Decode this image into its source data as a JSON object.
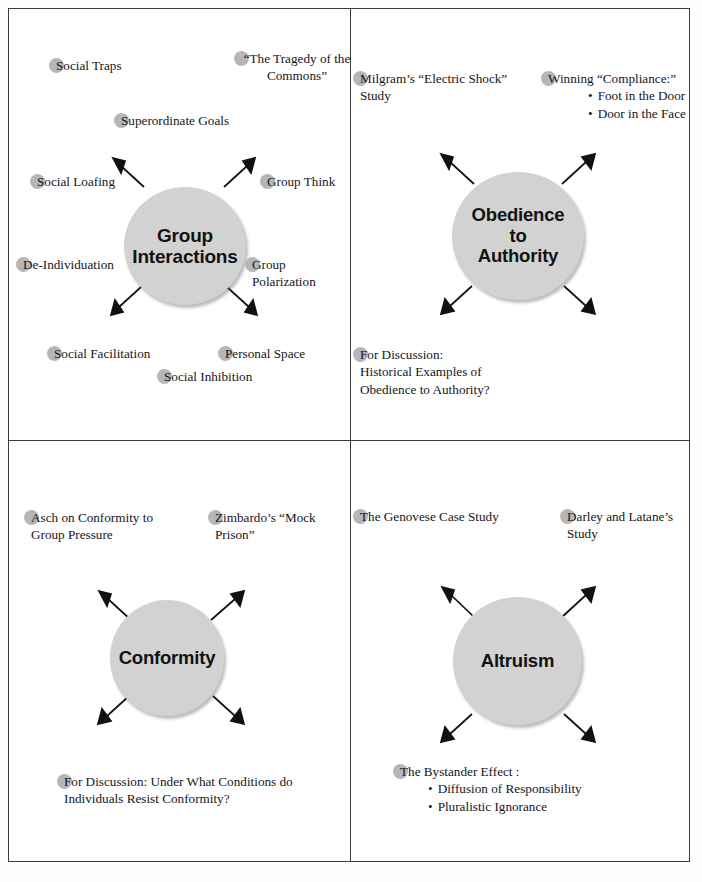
{
  "page": {
    "title": "Social Psychology",
    "title_visible": false,
    "colors": {
      "node_fill": "#d2d2d2",
      "dot_marker": "#b6b6b6",
      "frame_line": "#3b3b3f",
      "text": "#15151a",
      "arrow": "#111111"
    }
  },
  "quadrants": [
    {
      "id": "group-interactions",
      "node_label": "Group\nInteractions",
      "labels": [
        {
          "id": "social-traps",
          "text": "Social Traps"
        },
        {
          "id": "tragedy-commons",
          "text": "“The Tragedy of the\nCommons”"
        },
        {
          "id": "superordinate-goals",
          "text": "Superordinate Goals"
        },
        {
          "id": "social-loafing",
          "text": "Social Loafing"
        },
        {
          "id": "group-think",
          "text": "Group Think"
        },
        {
          "id": "de-individuation",
          "text": "De-Individuation"
        },
        {
          "id": "group-polarization",
          "text": "Group Polarization"
        },
        {
          "id": "social-facilitation",
          "text": "Social Facilitation"
        },
        {
          "id": "personal-space",
          "text": "Personal Space"
        },
        {
          "id": "social-inhibition",
          "text": "Social Inhibition"
        }
      ]
    },
    {
      "id": "obedience-to-authority",
      "node_label": "Obedience\nto\nAuthority",
      "labels": [
        {
          "id": "milgram-study",
          "text": "Milgram’s “Electric Shock”\n     Study"
        },
        {
          "id": "winning-compliance",
          "text": "Winning “Compliance:”",
          "sublist": [
            "Foot in the Door",
            "Door in the Face"
          ]
        },
        {
          "id": "for-discussion-obedience",
          "text": "For Discussion:\n   Historical Examples of\n   Obedience to Authority?"
        }
      ]
    },
    {
      "id": "conformity",
      "node_label": "Conformity",
      "labels": [
        {
          "id": "asch-conformity",
          "text": "Asch on Conformity to\n    Group Pressure"
        },
        {
          "id": "zimbardo-mock-prison",
          "text": "Zimbardo’s “Mock\n   Prison”"
        },
        {
          "id": "for-discussion-conformity",
          "text": "For Discussion: Under What Conditions do\n    Individuals Resist Conformity?"
        }
      ]
    },
    {
      "id": "altruism",
      "node_label": "Altruism",
      "labels": [
        {
          "id": "genovese-case",
          "text": "The Genovese Case Study"
        },
        {
          "id": "darley-latane",
          "text": "Darley and Latane’s Study"
        },
        {
          "id": "bystander-effect",
          "text": "The Bystander Effect :",
          "sublist": [
            "Diffusion of Responsibility",
            "Pluralistic Ignorance"
          ]
        }
      ]
    }
  ]
}
